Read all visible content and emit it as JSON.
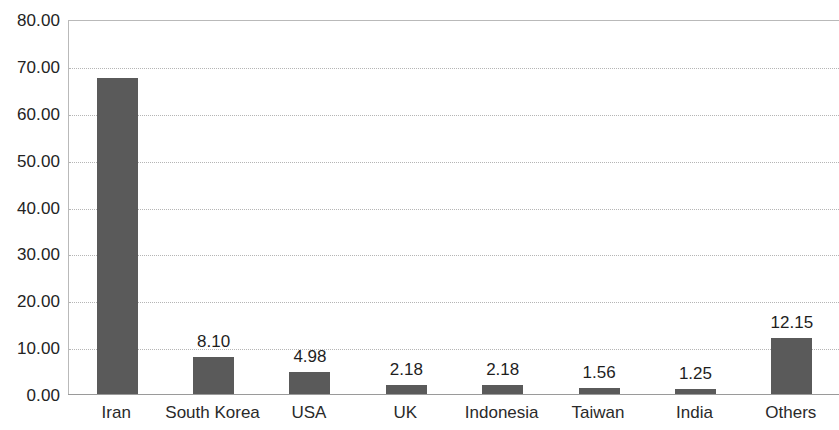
{
  "chart_data": {
    "type": "bar",
    "title": "",
    "subtitle": "",
    "xlabel": "",
    "ylabel": "",
    "categories": [
      "Iran",
      "South Korea",
      "USA",
      "UK",
      "Indonesia",
      "Taiwan",
      "India",
      "Others"
    ],
    "values": [
      67.6,
      8.1,
      4.98,
      2.18,
      2.18,
      1.56,
      1.25,
      12.15
    ],
    "data_labels": [
      "",
      "8.10",
      "4.98",
      "2.18",
      "2.18",
      "1.56",
      "1.25",
      "12.15"
    ],
    "ylim": [
      0,
      80
    ],
    "ytick_step": 10,
    "ytick_labels": [
      "80.00",
      "70.00",
      "60.00",
      "50.00",
      "40.00",
      "30.00",
      "20.00",
      "10.00",
      "0.00"
    ],
    "ytick_values": [
      80,
      70,
      60,
      50,
      40,
      30,
      20,
      10,
      0
    ],
    "grid": true,
    "grid_axis": "y",
    "legend": false,
    "legend_position": "none",
    "series": [
      {
        "name": "",
        "values": [
          67.6,
          8.1,
          4.98,
          2.18,
          2.18,
          1.56,
          1.25,
          12.15
        ],
        "color": "#5a5a5a"
      }
    ]
  },
  "colors": {
    "bar": "#5a5a5a",
    "grid": "#b5b5b5",
    "axis": "#9a9a9a",
    "text": "#232323",
    "background": "#ffffff"
  }
}
